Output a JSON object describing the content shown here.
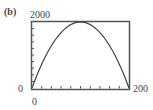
{
  "panel_label": "(b)",
  "window": {
    "ymax_label": "2000",
    "ymin_label": "0",
    "xmax_label": "200",
    "xmin_label": "0"
  },
  "colors": {
    "frame": "#555555",
    "curve": "#444444",
    "background": "#ffffff"
  },
  "chart_data": {
    "type": "line",
    "title": "(b)",
    "xlabel": "",
    "ylabel": "",
    "xlim": [
      0,
      200
    ],
    "ylim": [
      0,
      2000
    ],
    "x_tick_count": 10,
    "y_tick_count": 10,
    "grid": false,
    "series": [
      {
        "name": "parabola",
        "description": "downward-opening parabola with zeros at x=0 and x=200, vertex near (100, 2000)",
        "x": [
          0,
          20,
          40,
          60,
          80,
          100,
          120,
          140,
          160,
          180,
          200
        ],
        "y": [
          0,
          720,
          1280,
          1680,
          1920,
          2000,
          1920,
          1680,
          1280,
          720,
          0
        ]
      }
    ]
  }
}
